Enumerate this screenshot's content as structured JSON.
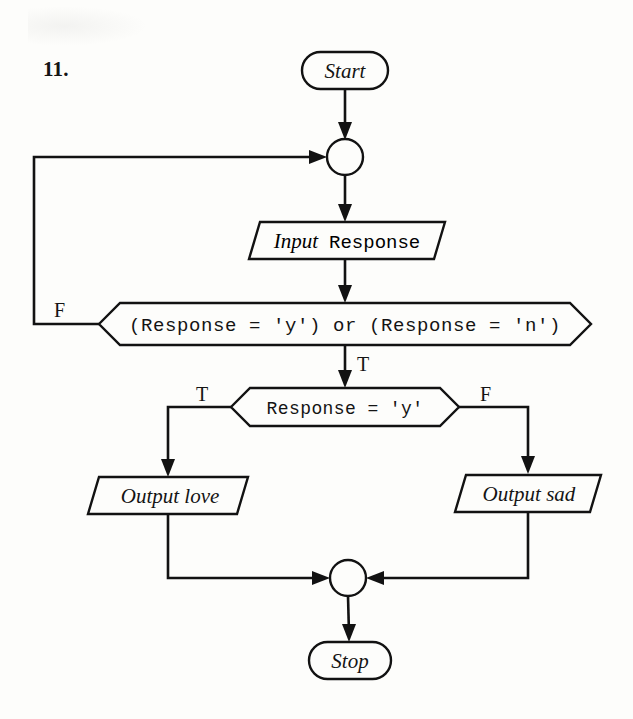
{
  "page": {
    "question_number": "11.",
    "background_color": "#fdfdfb",
    "ink_color": "#121212"
  },
  "diagram": {
    "type": "flowchart",
    "nodes": [
      {
        "id": "start",
        "kind": "terminator",
        "label": "Start",
        "text_style": "italic-serif",
        "cx": 345,
        "cy": 70,
        "width": 86,
        "height": 37
      },
      {
        "id": "junction-top",
        "kind": "connector-circle",
        "label": "",
        "cx": 345,
        "cy": 157,
        "radius": 18
      },
      {
        "id": "input-response",
        "kind": "input-output",
        "label_italic": "Input",
        "label_mono": "Response",
        "label": "Input Response",
        "cx": 347,
        "cy": 240,
        "width": 196,
        "height": 37
      },
      {
        "id": "decision-valid",
        "kind": "decision",
        "label": "(Response = 'y') or (Response = 'n')",
        "text_style": "mono",
        "cx": 345,
        "cy": 324,
        "width": 492,
        "height": 42
      },
      {
        "id": "decision-isy",
        "kind": "decision",
        "label": "Response = 'y'",
        "text_style": "mono",
        "cx": 345,
        "cy": 407,
        "width": 228,
        "height": 38
      },
      {
        "id": "output-love",
        "kind": "input-output",
        "label": "Output love",
        "text_style": "italic-serif",
        "cx": 168,
        "cy": 495,
        "width": 160,
        "height": 37
      },
      {
        "id": "output-sad",
        "kind": "input-output",
        "label": "Output sad",
        "text_style": "italic-serif",
        "cx": 528,
        "cy": 493,
        "width": 146,
        "height": 37
      },
      {
        "id": "junction-bottom",
        "kind": "connector-circle",
        "label": "",
        "cx": 348,
        "cy": 578,
        "radius": 18
      },
      {
        "id": "stop",
        "kind": "terminator",
        "label": "Stop",
        "text_style": "italic-serif",
        "cx": 350,
        "cy": 660,
        "width": 82,
        "height": 37
      }
    ],
    "edges": [
      {
        "id": "e-start-junction",
        "from": "start",
        "to": "junction-top",
        "label": ""
      },
      {
        "id": "e-junction-input",
        "from": "junction-top",
        "to": "input-response",
        "label": ""
      },
      {
        "id": "e-input-decision",
        "from": "input-response",
        "to": "decision-valid",
        "label": ""
      },
      {
        "id": "e-decision-false-loop",
        "from": "decision-valid",
        "to": "junction-top",
        "label": "F"
      },
      {
        "id": "e-decision-true",
        "from": "decision-valid",
        "to": "decision-isy",
        "label": "T"
      },
      {
        "id": "e-isy-true",
        "from": "decision-isy",
        "to": "output-love",
        "label": "T"
      },
      {
        "id": "e-isy-false",
        "from": "decision-isy",
        "to": "output-sad",
        "label": "F"
      },
      {
        "id": "e-love-junction",
        "from": "output-love",
        "to": "junction-bottom",
        "label": ""
      },
      {
        "id": "e-sad-junction",
        "from": "output-sad",
        "to": "junction-bottom",
        "label": ""
      },
      {
        "id": "e-junction-stop",
        "from": "junction-bottom",
        "to": "stop",
        "label": ""
      }
    ],
    "branch_labels": {
      "loop_false": "F",
      "valid_true": "T",
      "isy_true": "T",
      "isy_false": "F"
    }
  }
}
